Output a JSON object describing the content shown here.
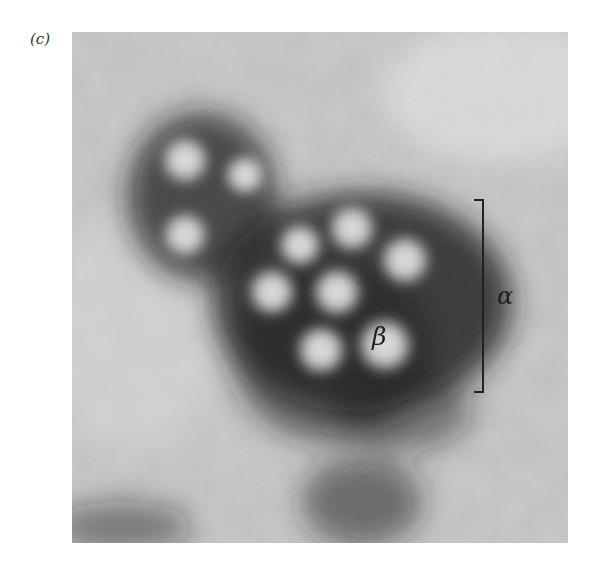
{
  "figure": {
    "panel_label": "(c)",
    "image_type": "electron micrograph",
    "annotations": {
      "bracket_label": "α",
      "particle_label": "β"
    }
  }
}
